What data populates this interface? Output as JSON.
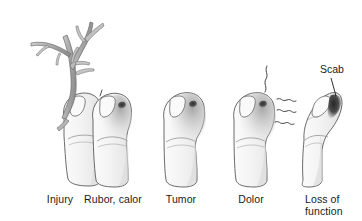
{
  "figure": {
    "title_visible": false,
    "background_color": "#ffffff",
    "ink_color": "#4a4a4a",
    "text_color": "#1a1a1a",
    "skin_fill": "#f2f2f2",
    "skin_shade": "#d8d8d8",
    "wound_color": "#3f3f3f",
    "branch_fill": "#b9b9b9"
  },
  "panels": [
    {
      "id": "injury",
      "label": "Injury",
      "label_x": 60,
      "label_y": 196,
      "label_lines": [
        "Injury"
      ],
      "has_branch": true,
      "has_impact_marks": true,
      "has_swelling": false,
      "has_pain_lines": false,
      "is_flexed": false,
      "wound_visible": false
    },
    {
      "id": "rubor-calor",
      "label": "Rubor, calor",
      "label_x": 113,
      "label_y": 196,
      "label_lines": [
        "Rubor, calor"
      ],
      "has_branch": false,
      "has_impact_marks": false,
      "has_swelling": true,
      "has_pain_lines": false,
      "is_flexed": false,
      "wound_visible": true
    },
    {
      "id": "tumor",
      "label": "Tumor",
      "label_x": 182,
      "label_y": 196,
      "label_lines": [
        "Tumor"
      ],
      "has_branch": false,
      "has_impact_marks": false,
      "has_swelling": true,
      "has_pain_lines": false,
      "is_flexed": false,
      "wound_visible": true
    },
    {
      "id": "dolor",
      "label": "Dolor",
      "label_x": 252,
      "label_y": 196,
      "label_lines": [
        "Dolor"
      ],
      "has_branch": false,
      "has_impact_marks": false,
      "has_swelling": true,
      "has_pain_lines": true,
      "is_flexed": false,
      "wound_visible": true
    },
    {
      "id": "loss-of-function",
      "label": "Loss of function",
      "label_x": 306,
      "label_y": 196,
      "label_lines": [
        "Loss of",
        "function"
      ],
      "has_branch": false,
      "has_impact_marks": false,
      "has_swelling": false,
      "has_pain_lines": false,
      "is_flexed": true,
      "wound_visible": true
    }
  ],
  "annotations": [
    {
      "id": "scab",
      "text": "Scab",
      "text_x": 320,
      "text_y": 63,
      "leader_from": [
        331,
        78
      ],
      "leader_to": [
        318,
        97
      ]
    }
  ]
}
